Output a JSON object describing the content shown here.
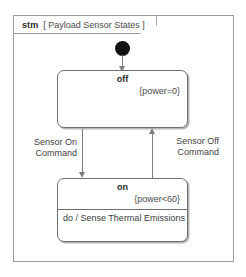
{
  "diagram": {
    "frame": {
      "kind": "stm",
      "name": "[ Payload Sensor States ]"
    },
    "initial_node": {
      "label": "initial-pseudostate"
    },
    "states": [
      {
        "id": "off",
        "title": "off",
        "constraint": "{power=0}",
        "activity": ""
      },
      {
        "id": "on",
        "title": "on",
        "constraint": "{power<60}",
        "activity": "do / Sense Thermal Emissions"
      }
    ],
    "transitions": [
      {
        "id": "initial-to-off",
        "label": "",
        "from": "initial",
        "to": "off"
      },
      {
        "id": "off-to-on",
        "label": "Sensor On\nCommand",
        "label_line1": "Sensor On",
        "label_line2": "Command",
        "from": "off",
        "to": "on"
      },
      {
        "id": "on-to-off",
        "label": "Sensor Off\nCommand",
        "label_line1": "Sensor Off",
        "label_line2": "Command",
        "from": "on",
        "to": "off"
      }
    ]
  },
  "colors": {
    "background": "#ffffff",
    "frame_border": "#9a9a9a",
    "state_border": "#6e6e6e",
    "edge": "#7d7d7d",
    "initial_fill": "#111111",
    "text": "#3a3a3a"
  }
}
